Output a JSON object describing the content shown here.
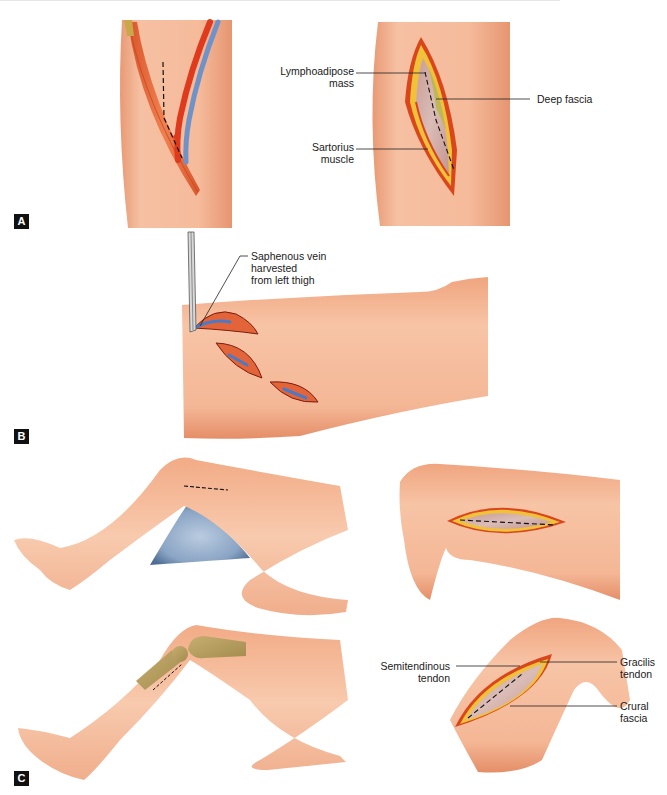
{
  "figure": {
    "panels": [
      {
        "id": "A",
        "tag": "A",
        "subfigures": [
          {
            "name": "thigh-vessels",
            "description": "Thigh with sartorius muscle, femoral artery and vein, dashed incision line"
          },
          {
            "name": "thigh-incision-open",
            "labels": [
              "Lymphoadipose\nmass",
              "Deep fascia",
              "Sartorius\nmuscle"
            ]
          }
        ]
      },
      {
        "id": "B",
        "tag": "B",
        "subfigures": [
          {
            "name": "thigh-skip-incisions",
            "labels": [
              "Saphenous vein\nharvested\nfrom left thigh"
            ],
            "incision_count": 3
          }
        ]
      },
      {
        "id": "C",
        "tag": "C",
        "subfigures": [
          {
            "name": "leg-on-wedge",
            "description": "Bent leg resting on blue wedge pillow with dashed incision above knee"
          },
          {
            "name": "thigh-horizontal-incision"
          },
          {
            "name": "leg-with-bones",
            "description": "Bent leg with femur and tibia shown, dashed incision below knee"
          },
          {
            "name": "knee-incision-open",
            "labels": [
              "Semitendinous\ntendon",
              "Gracilis\ntendon",
              "Crural\nfascia"
            ]
          }
        ]
      }
    ],
    "labels": {
      "lymphoadipose": "Lymphoadipose\nmass",
      "deep_fascia": "Deep fascia",
      "sartorius": "Sartorius\nmuscle",
      "saphenous": "Saphenous vein\nharvested\nfrom left thigh",
      "semitendinous": "Semitendinous\ntendon",
      "gracilis": "Gracilis\ntendon",
      "crural": "Crural\nfascia"
    },
    "tags": {
      "a": "A",
      "b": "B",
      "c": "C"
    },
    "colors": {
      "skin": "#f3b08f",
      "skin_shadow": "#e28a62",
      "muscle": "#e8653a",
      "artery": "#e03a1e",
      "vein": "#6f93c9",
      "fat": "#f2c13a",
      "incision_rim": "#d9461c",
      "fascia": "#cfa8a4",
      "lymph": "#b7b84a",
      "wedge": "#7f9bbd",
      "bone": "#b8a060",
      "tag_bg": "#111111"
    }
  }
}
